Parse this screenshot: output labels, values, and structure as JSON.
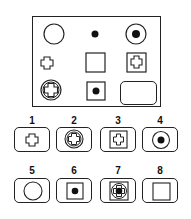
{
  "matrix": {
    "rows": [
      [
        "circle",
        "dot",
        "circle-with-dot"
      ],
      [
        "cross",
        "square",
        "square-with-cross"
      ],
      [
        "circle-with-cross",
        "square-with-dot",
        "blank"
      ]
    ]
  },
  "options": [
    {
      "label": "1",
      "figure": "cross"
    },
    {
      "label": "2",
      "figure": "circle-with-cross"
    },
    {
      "label": "3",
      "figure": "square-with-cross"
    },
    {
      "label": "4",
      "figure": "circle-with-dot"
    },
    {
      "label": "5",
      "figure": "circle"
    },
    {
      "label": "6",
      "figure": "square-with-dot"
    },
    {
      "label": "7",
      "figure": "square-circle-cross-dot"
    },
    {
      "label": "8",
      "figure": "square"
    }
  ]
}
